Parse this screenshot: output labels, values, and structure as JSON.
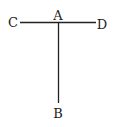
{
  "diagram": {
    "type": "T-shaped line diagram",
    "line_color": "#222222",
    "points": [
      {
        "id": "A",
        "label": "A",
        "x": 58,
        "y": 22,
        "label_x": 58,
        "label_y": 20
      },
      {
        "id": "B",
        "label": "B",
        "x": 58,
        "y": 103,
        "label_x": 58,
        "label_y": 118
      },
      {
        "id": "C",
        "label": "C",
        "x": 20,
        "y": 22,
        "label_x": 13,
        "label_y": 27
      },
      {
        "id": "D",
        "label": "D",
        "x": 96,
        "y": 22,
        "label_x": 102,
        "label_y": 29
      }
    ],
    "segments": [
      {
        "from": "C",
        "to": "D"
      },
      {
        "from": "A",
        "to": "B"
      }
    ]
  }
}
